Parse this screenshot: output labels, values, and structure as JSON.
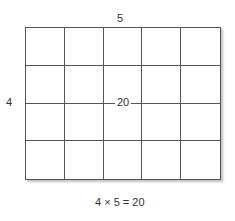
{
  "diagram": {
    "type": "area-model-grid",
    "rows": 4,
    "columns": 5,
    "labels": {
      "top": "5",
      "side": "4",
      "center": "20"
    },
    "caption": "4 × 5 = 20"
  }
}
